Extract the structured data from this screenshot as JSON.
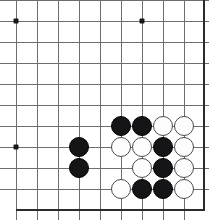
{
  "board": {
    "title": "Go board position",
    "game": "go",
    "cell_size": 21,
    "stone_diameter": 20,
    "origin_x": 16,
    "origin_y": 0,
    "grid_colors": {
      "line": "#6e6e70",
      "edge": "#2b2b2d",
      "star": "#18181a",
      "black_stone": "#151517",
      "white_stone": "#fdfdfd",
      "white_stone_outline": "#4a4a4d",
      "background": "#ffffff"
    },
    "crop_note": "corner view; board continues off the top and left edges",
    "vertical_lines": [
      16,
      37,
      58,
      79,
      100,
      121,
      142,
      163,
      184
    ],
    "horizontal_lines": [
      0,
      21,
      42,
      63,
      84,
      105,
      126,
      147,
      168,
      189
    ],
    "edges": [
      {
        "name": "right-edge",
        "orientation": "vertical",
        "pos": 203,
        "from": 0,
        "to": 210
      },
      {
        "name": "bottom-edge",
        "orientation": "horizontal",
        "pos": 209,
        "from": 16,
        "to": 205
      }
    ],
    "star_points": [
      {
        "x": 16,
        "y": 21
      },
      {
        "x": 142,
        "y": 21
      },
      {
        "x": 16,
        "y": 147
      }
    ],
    "stones": [
      {
        "color": "black",
        "x": 79,
        "y": 147
      },
      {
        "color": "black",
        "x": 79,
        "y": 168
      },
      {
        "color": "black",
        "x": 121,
        "y": 126
      },
      {
        "color": "black",
        "x": 142,
        "y": 126
      },
      {
        "color": "white",
        "x": 163,
        "y": 126
      },
      {
        "color": "white",
        "x": 184,
        "y": 126
      },
      {
        "color": "white",
        "x": 121,
        "y": 147
      },
      {
        "color": "white",
        "x": 142,
        "y": 147
      },
      {
        "color": "black",
        "x": 163,
        "y": 147
      },
      {
        "color": "white",
        "x": 184,
        "y": 147
      },
      {
        "color": "white",
        "x": 142,
        "y": 168
      },
      {
        "color": "black",
        "x": 163,
        "y": 168
      },
      {
        "color": "white",
        "x": 184,
        "y": 168
      },
      {
        "color": "white",
        "x": 121,
        "y": 189
      },
      {
        "color": "black",
        "x": 142,
        "y": 189
      },
      {
        "color": "black",
        "x": 163,
        "y": 189
      },
      {
        "color": "white",
        "x": 184,
        "y": 189
      }
    ],
    "counts": {
      "black_stones": 8,
      "white_stones": 9,
      "total_stones": 17
    }
  }
}
